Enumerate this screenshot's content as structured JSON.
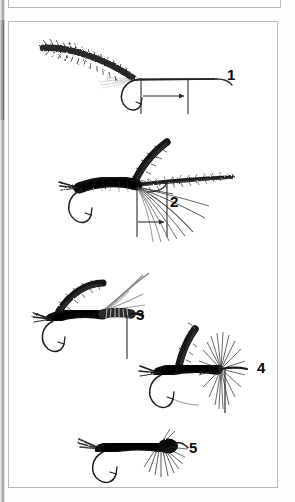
{
  "document": {
    "type": "fly-tying step illustration plate",
    "background_color": "#ffffff",
    "frame_border_color": "#b9b9b9",
    "ink_color": "#111111",
    "panel_above_label": ""
  },
  "figures": [
    {
      "number": "1",
      "caption": "",
      "description": "Bare hook with thread base and long tapered fiber bundle tied in, extending back over the shank; two vertical gauge lines with a horizontal double-headed measuring arrow between them below the shank",
      "elements": [
        "hook",
        "thread-wrap",
        "fiber-bundle",
        "gauge-line-left",
        "gauge-line-right",
        "measure-arrow"
      ]
    },
    {
      "number": "2",
      "caption": "",
      "description": "Dubbed tapered body on hook with short split tail, an upright dark wing case stub and a long horizontal fiber wing; splayed hackle fibers sweep down and back; vertical gauge lines with measuring arrow below",
      "elements": [
        "hook",
        "tail",
        "dubbed-body",
        "wing-case",
        "fiber-wing",
        "hackle-fibers",
        "gauge-line-left",
        "gauge-line-right",
        "measure-arrow"
      ]
    },
    {
      "number": "3",
      "caption": "",
      "description": "Dubbed body fly with short tail, dark wing case folded forward and translucent fiber wings angled up and back; ribbed thorax; single vertical index line dropping from the thorax",
      "elements": [
        "hook",
        "tail",
        "dubbed-body",
        "wing-case",
        "fiber-wing",
        "thorax-ribbing",
        "index-line"
      ]
    },
    {
      "number": "4",
      "caption": "",
      "description": "Fly with wing case pulled over thorax and hackle fibers flared into a full radiating collar; single vertical index line dropping through the hackle collar",
      "elements": [
        "hook",
        "tail",
        "dubbed-body",
        "wing-case",
        "hackle-collar",
        "index-line"
      ]
    },
    {
      "number": "5",
      "caption": "",
      "description": "Finished fly: compact dark dubbed body, short forked tail, bulky head and downward-sweeping hackle legs; no gauge lines",
      "elements": [
        "hook",
        "tail",
        "dubbed-body",
        "head",
        "hackle-legs"
      ]
    }
  ]
}
